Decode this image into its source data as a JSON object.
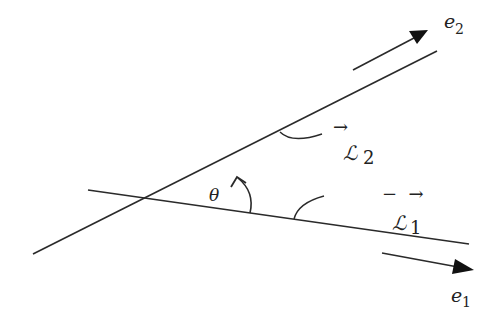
{
  "diagram": {
    "labels": {
      "e2": {
        "base": "e",
        "sub": "2"
      },
      "e1": {
        "base": "e",
        "sub": "1"
      },
      "L2": {
        "base": "ℒ",
        "sub": "2",
        "arrow": "→"
      },
      "L1": {
        "base": "ℒ",
        "sub": "1",
        "arrow": "−  →"
      },
      "theta": "θ"
    },
    "colors": {
      "stroke": "#2a2a2a",
      "background": "#ffffff"
    }
  }
}
